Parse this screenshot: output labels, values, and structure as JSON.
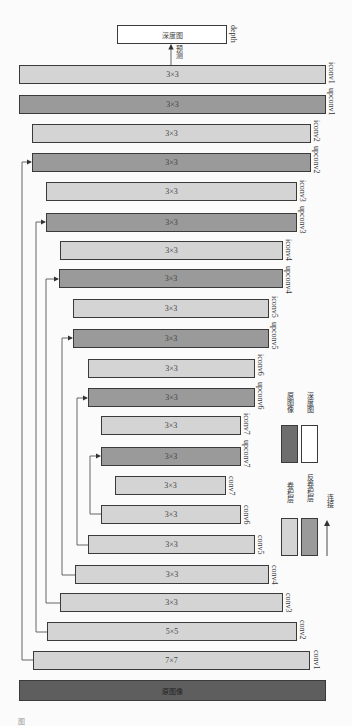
{
  "output": {
    "box_label": "深度图",
    "side_label": "depth",
    "arrow_label": "预测"
  },
  "layers": [
    {
      "name": "iconv1",
      "kernel": "3×3",
      "type": "conv"
    },
    {
      "name": "upconv1",
      "kernel": "3×3",
      "type": "deconv"
    },
    {
      "name": "iconv2",
      "kernel": "3×3",
      "type": "conv"
    },
    {
      "name": "upconv2",
      "kernel": "3×3",
      "type": "deconv"
    },
    {
      "name": "iconv3",
      "kernel": "3×3",
      "type": "conv"
    },
    {
      "name": "upconv3",
      "kernel": "3×3",
      "type": "deconv"
    },
    {
      "name": "iconv4",
      "kernel": "3×3",
      "type": "conv"
    },
    {
      "name": "upconv4",
      "kernel": "3×3",
      "type": "deconv"
    },
    {
      "name": "iconv5",
      "kernel": "3×3",
      "type": "conv"
    },
    {
      "name": "upconv5",
      "kernel": "3×3",
      "type": "deconv"
    },
    {
      "name": "iconv6",
      "kernel": "3×3",
      "type": "conv"
    },
    {
      "name": "upconv6",
      "kernel": "3×3",
      "type": "deconv"
    },
    {
      "name": "iconv7",
      "kernel": "3×3",
      "type": "conv"
    },
    {
      "name": "upconv7",
      "kernel": "3×3",
      "type": "deconv"
    },
    {
      "name": "conv7",
      "kernel": "3×3",
      "type": "conv"
    },
    {
      "name": "conv6",
      "kernel": "3×3",
      "type": "conv"
    },
    {
      "name": "conv5",
      "kernel": "3×3",
      "type": "conv"
    },
    {
      "name": "conv4",
      "kernel": "3×3",
      "type": "conv"
    },
    {
      "name": "conv3",
      "kernel": "3×3",
      "type": "conv"
    },
    {
      "name": "conv2",
      "kernel": "5×5",
      "type": "conv"
    },
    {
      "name": "conv1",
      "kernel": "7×7",
      "type": "conv"
    }
  ],
  "input": {
    "label": "原图像"
  },
  "legend": {
    "conv": "卷积层",
    "deconv": "反卷积层",
    "link": "连接",
    "input": "原图像",
    "depth": "深度图"
  },
  "footer": {
    "fig_mark": "图"
  },
  "colors": {
    "conv": "#d4d4d4",
    "deconv": "#9a9a9a",
    "input": "#5e5e5e",
    "depth": "#ffffff"
  }
}
